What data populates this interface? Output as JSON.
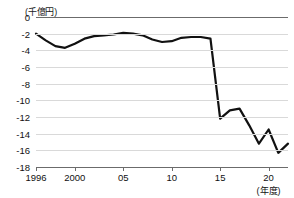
{
  "chart_data": {
    "type": "line",
    "title": "",
    "subtitle": "",
    "unit_label": "(千億円)",
    "xlabel": "(年度)",
    "ylabel": "",
    "ylim": [
      -18,
      0
    ],
    "xlim": [
      1996,
      2022
    ],
    "grid": true,
    "legend": "none",
    "ytick_labels": [
      "0",
      "-2",
      "-4",
      "-6",
      "-8",
      "-10",
      "-12",
      "-14",
      "-16",
      "-18"
    ],
    "ytick_values": [
      0,
      -2,
      -4,
      -6,
      -8,
      -10,
      -12,
      -14,
      -16,
      -18
    ],
    "xtick_labels": [
      "1996",
      "2000",
      "05",
      "10",
      "15",
      "20"
    ],
    "xtick_values": [
      1996,
      2000,
      2005,
      2010,
      2015,
      2020
    ],
    "x": [
      1996,
      1997,
      1998,
      1999,
      2000,
      2001,
      2002,
      2003,
      2004,
      2005,
      2006,
      2007,
      2008,
      2009,
      2010,
      2011,
      2012,
      2013,
      2014,
      2015,
      2016,
      2017,
      2018,
      2019,
      2020,
      2021,
      2022
    ],
    "values": [
      -2.0,
      -2.8,
      -3.5,
      -3.7,
      -3.2,
      -2.6,
      -2.3,
      -2.2,
      -2.1,
      -1.9,
      -2.0,
      -2.2,
      -2.7,
      -3.0,
      -2.9,
      -2.5,
      -2.4,
      -2.4,
      -2.6,
      -12.2,
      -11.2,
      -11.0,
      -13.0,
      -15.2,
      -13.5,
      -16.3,
      -15.2
    ],
    "series": [
      {
        "name": "",
        "color": "#111111",
        "values": [
          -2.0,
          -2.8,
          -3.5,
          -3.7,
          -3.2,
          -2.6,
          -2.3,
          -2.2,
          -2.1,
          -1.9,
          -2.0,
          -2.2,
          -2.7,
          -3.0,
          -2.9,
          -2.5,
          -2.4,
          -2.4,
          -2.6,
          -12.2,
          -11.2,
          -11.0,
          -13.0,
          -15.2,
          -13.5,
          -16.3,
          -15.2
        ]
      }
    ]
  }
}
